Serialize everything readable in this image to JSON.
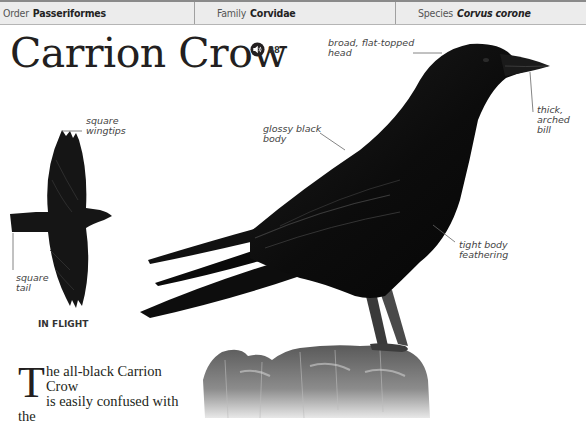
{
  "taxonomy": {
    "order_label": "Order",
    "order_value": "Passeriformes",
    "family_label": "Family",
    "family_value": "Corvidae",
    "species_label": "Species",
    "species_value": "Corvus corone"
  },
  "title": "Carrion Crow",
  "audio": {
    "icon": "speaker-icon",
    "track_number": "88"
  },
  "annotations": {
    "head": [
      "broad, flat-topped",
      "head"
    ],
    "bill": [
      "thick,",
      "arched",
      "bill"
    ],
    "body": [
      "glossy black",
      "body"
    ],
    "feathering": [
      "tight body",
      "feathering"
    ],
    "wingtips": [
      "square",
      "wingtips"
    ],
    "tail": [
      "square",
      "tail"
    ]
  },
  "flight_caption": "IN FLIGHT",
  "intro": {
    "dropcap": "T",
    "line1": "he all-black Carrion Crow",
    "line2": "is easily confused with the"
  }
}
